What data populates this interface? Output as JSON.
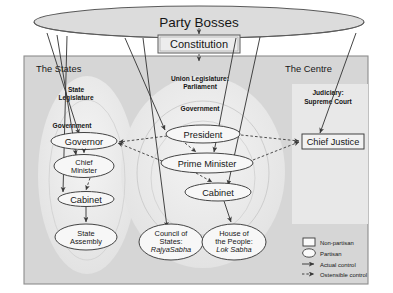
{
  "diagram": {
    "colors": {
      "frame_border": "#8d8d8d",
      "panel_fill": "#d6d6d6",
      "inner_fill": "#efefef",
      "node_fill": "#f7f7f7",
      "line": "#3a3a3a",
      "page_bg": "#ffffff",
      "text": "#161616"
    },
    "top": {
      "party_bosses": "Party Bosses",
      "constitution": "Constitution"
    },
    "zones": [
      {
        "id": "states",
        "label": "The States"
      },
      {
        "id": "union",
        "label": "Union Legislature:\nParliament"
      },
      {
        "id": "centre",
        "label": "The Centre"
      }
    ],
    "group_labels": [
      {
        "id": "state-legislature",
        "line1": "State",
        "line2": "Legislature"
      },
      {
        "id": "state-government",
        "line1": "Government",
        "line2": ""
      },
      {
        "id": "union-legislature",
        "line1": "Union Legislature:",
        "line2": "Parliament"
      },
      {
        "id": "union-government",
        "line1": "Government",
        "line2": ""
      },
      {
        "id": "judiciary",
        "line1": "Judiciary:",
        "line2": "Supreme Court"
      }
    ],
    "nodes": [
      {
        "id": "governor",
        "lines": [
          "Governor"
        ],
        "shape": "ellipse",
        "kind": "partisan"
      },
      {
        "id": "chief-minister",
        "lines": [
          "Chief",
          "Minister"
        ],
        "shape": "ellipse",
        "kind": "partisan"
      },
      {
        "id": "state-cabinet",
        "lines": [
          "Cabinet"
        ],
        "shape": "ellipse",
        "kind": "partisan"
      },
      {
        "id": "state-assembly",
        "lines": [
          "State",
          "Assembly"
        ],
        "shape": "ellipse",
        "kind": "partisan"
      },
      {
        "id": "president",
        "lines": [
          "President"
        ],
        "shape": "ellipse",
        "kind": "partisan"
      },
      {
        "id": "prime-minister",
        "lines": [
          "Prime Minister"
        ],
        "shape": "ellipse",
        "kind": "partisan"
      },
      {
        "id": "union-cabinet",
        "lines": [
          "Cabinet"
        ],
        "shape": "ellipse",
        "kind": "partisan"
      },
      {
        "id": "rajya-sabha",
        "lines": [
          "Council of",
          "States:",
          "RajyaSabha"
        ],
        "shape": "ellipse",
        "kind": "partisan",
        "italic_last": true
      },
      {
        "id": "lok-sabha",
        "lines": [
          "House of",
          "the People:",
          "Lok Sabha"
        ],
        "shape": "ellipse",
        "kind": "partisan",
        "italic_last": true
      },
      {
        "id": "chief-justice",
        "lines": [
          "Chief Justice"
        ],
        "shape": "box",
        "kind": "non-partisan"
      }
    ],
    "edges": [
      {
        "from": "party-bosses",
        "to": "constitution",
        "type": "ostensible"
      },
      {
        "from": "constitution",
        "to": "union",
        "type": "ostensible"
      },
      {
        "from": "party-bosses",
        "to": "governor",
        "type": "actual"
      },
      {
        "from": "party-bosses",
        "to": "chief-minister",
        "type": "actual"
      },
      {
        "from": "party-bosses",
        "to": "state-cabinet",
        "type": "actual"
      },
      {
        "from": "party-bosses",
        "to": "president",
        "type": "actual"
      },
      {
        "from": "party-bosses",
        "to": "prime-minister",
        "type": "actual"
      },
      {
        "from": "party-bosses",
        "to": "union-cabinet",
        "type": "actual"
      },
      {
        "from": "party-bosses",
        "to": "rajya-sabha",
        "type": "actual"
      },
      {
        "from": "party-bosses",
        "to": "chief-justice",
        "type": "actual"
      },
      {
        "from": "governor",
        "to": "chief-minister",
        "type": "ostensible"
      },
      {
        "from": "chief-minister",
        "to": "state-cabinet",
        "type": "ostensible"
      },
      {
        "from": "state-cabinet",
        "to": "state-assembly",
        "type": "actual"
      },
      {
        "from": "president",
        "to": "prime-minister",
        "type": "ostensible"
      },
      {
        "from": "prime-minister",
        "to": "union-cabinet",
        "type": "ostensible"
      },
      {
        "from": "union-cabinet",
        "to": "lok-sabha",
        "type": "actual"
      },
      {
        "from": "president",
        "to": "governor",
        "type": "ostensible"
      },
      {
        "from": "prime-minister",
        "to": "governor",
        "type": "ostensible"
      },
      {
        "from": "president",
        "to": "chief-justice",
        "type": "ostensible"
      },
      {
        "from": "prime-minister",
        "to": "chief-justice",
        "type": "ostensible"
      }
    ],
    "legend": {
      "items": [
        {
          "id": "non-partisan",
          "label": "Non-partisan",
          "glyph": "square-outline"
        },
        {
          "id": "partisan",
          "label": "Partisan",
          "glyph": "ellipse-outline"
        },
        {
          "id": "actual-control",
          "label": "Actual control",
          "glyph": "solid-arrow"
        },
        {
          "id": "ostensible-control",
          "label": "Ostensible control",
          "glyph": "dashed-arrow"
        }
      ]
    }
  }
}
